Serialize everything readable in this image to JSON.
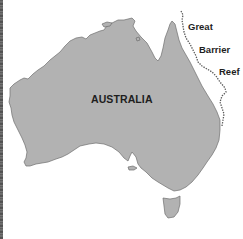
{
  "map": {
    "type": "outline map",
    "background_color": "#ffffff",
    "land_color": "#b2b2b2",
    "coastline_color": "#6e6e6e",
    "reef_line_color": "#5a5a5a",
    "labels": {
      "country": "AUSTRALIA",
      "reef_line_1": "Great",
      "reef_line_2": "Barrier",
      "reef_line_3": "Reef"
    },
    "features": [
      {
        "name": "Australia mainland",
        "kind": "landmass"
      },
      {
        "name": "Tasmania",
        "kind": "island"
      },
      {
        "name": "Great Barrier Reef",
        "kind": "dashed reef line along northeast coast"
      }
    ]
  }
}
